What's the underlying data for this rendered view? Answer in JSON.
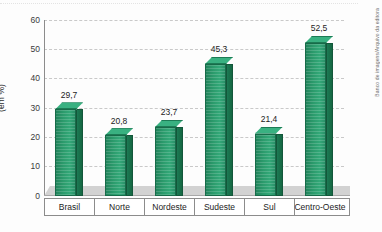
{
  "chart_data": {
    "type": "bar",
    "title": "",
    "subtitle": "",
    "xlabel": "",
    "ylabel": "(em %)",
    "ylim": [
      0,
      60
    ],
    "yticks": [
      0,
      10,
      20,
      30,
      40,
      50,
      60
    ],
    "ytick_labels": [
      "0",
      "10",
      "20",
      "30",
      "40",
      "50",
      "60"
    ],
    "grid": true,
    "legend": null,
    "style_3d": true,
    "bar_color": "#2b9b6c",
    "bar_side_color": "#1c7a54",
    "bar_top_color": "#39b181",
    "categories": [
      "Brasil",
      "Norte",
      "Nordeste",
      "Sudeste",
      "Sul",
      "Centro-Oeste"
    ],
    "values": [
      29.7,
      20.8,
      23.7,
      45.3,
      21.4,
      52.5
    ],
    "value_labels": [
      "29,7",
      "20,8",
      "23,7",
      "45,3",
      "21,4",
      "52,5"
    ],
    "annotations": [
      "Banco de imagens/Arquivo da editora"
    ]
  },
  "axis": {
    "y_title": "(em %)",
    "ticks": [
      {
        "label": "60",
        "value": 60
      },
      {
        "label": "50",
        "value": 50
      },
      {
        "label": "40",
        "value": 40
      },
      {
        "label": "30",
        "value": 30
      },
      {
        "label": "20",
        "value": 20
      },
      {
        "label": "10",
        "value": 10
      },
      {
        "label": "0",
        "value": 0
      }
    ]
  },
  "credit": {
    "text": "Banco de imagens/Arquivo da editora"
  },
  "colors": {
    "bar_front": "#2b9b6c",
    "bar_side": "#1c7a54",
    "bar_top": "#39b181",
    "gridline": "#c9c9c9",
    "axis": "#8c8c8c",
    "floor": "#d2d2d2",
    "background": "#fdfdfd",
    "text": "#1c1c1c"
  }
}
